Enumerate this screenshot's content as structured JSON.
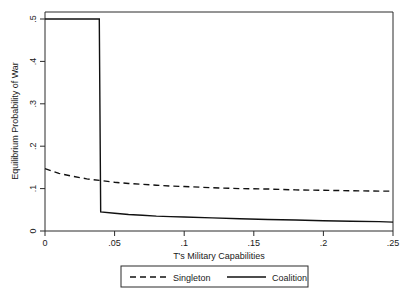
{
  "chart_data": {
    "type": "line",
    "title": "",
    "xlabel": "T's Military Capabilities",
    "ylabel": "Equilibrium Probability of War",
    "xlim": [
      0,
      0.25
    ],
    "ylim": [
      0,
      0.5
    ],
    "grid": false,
    "legend_position": "bottom",
    "xticks": [
      0,
      0.05,
      0.1,
      0.15,
      0.2,
      0.25
    ],
    "xtick_labels": [
      "0",
      ".05",
      ".1",
      ".15",
      ".2",
      ".25"
    ],
    "yticks": [
      0,
      0.1,
      0.2,
      0.3,
      0.4,
      0.5
    ],
    "ytick_labels": [
      "0",
      ".1",
      ".2",
      ".3",
      ".4",
      ".5"
    ],
    "series": [
      {
        "name": "Singleton",
        "style": "dashed",
        "color": "#111111",
        "x": [
          0.0,
          0.01,
          0.02,
          0.03,
          0.04,
          0.05,
          0.06,
          0.07,
          0.08,
          0.09,
          0.1,
          0.12,
          0.14,
          0.16,
          0.18,
          0.2,
          0.22,
          0.24,
          0.25
        ],
        "values": [
          0.147,
          0.136,
          0.129,
          0.123,
          0.119,
          0.115,
          0.112,
          0.11,
          0.108,
          0.106,
          0.105,
          0.102,
          0.1,
          0.099,
          0.097,
          0.096,
          0.095,
          0.094,
          0.094
        ]
      },
      {
        "name": "Coalition",
        "style": "solid",
        "color": "#111111",
        "x": [
          0.0,
          0.01,
          0.02,
          0.03,
          0.039,
          0.04,
          0.05,
          0.06,
          0.07,
          0.08,
          0.09,
          0.1,
          0.12,
          0.14,
          0.16,
          0.18,
          0.2,
          0.22,
          0.24,
          0.25
        ],
        "values": [
          0.5,
          0.5,
          0.5,
          0.5,
          0.5,
          0.045,
          0.042,
          0.039,
          0.037,
          0.035,
          0.034,
          0.033,
          0.031,
          0.029,
          0.027,
          0.026,
          0.024,
          0.023,
          0.022,
          0.021
        ]
      }
    ],
    "annotations": []
  },
  "legend": {
    "entries": [
      {
        "label": "Singleton",
        "style": "dashed"
      },
      {
        "label": "Coalition",
        "style": "solid"
      }
    ]
  }
}
